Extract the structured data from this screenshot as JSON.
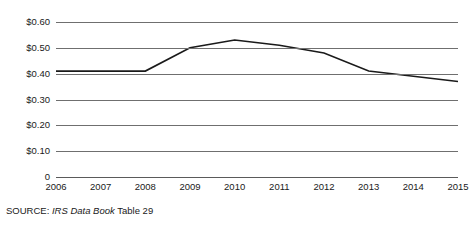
{
  "chart_data": {
    "type": "line",
    "title": "",
    "subtitle": "",
    "xlabel": "",
    "ylabel": "",
    "categories": [
      "2006",
      "2007",
      "2008",
      "2009",
      "2010",
      "2011",
      "2012",
      "2013",
      "2014",
      "2015"
    ],
    "values": [
      0.41,
      0.41,
      0.41,
      0.5,
      0.53,
      0.51,
      0.48,
      0.41,
      0.39,
      0.37
    ],
    "series": [
      {
        "name": "",
        "values": [
          0.41,
          0.41,
          0.41,
          0.5,
          0.53,
          0.51,
          0.48,
          0.41,
          0.39,
          0.37
        ]
      }
    ],
    "ylim": [
      0,
      0.6
    ],
    "xlim": [
      "2006",
      "2015"
    ],
    "ytick_values": [
      0.6,
      0.5,
      0.4,
      0.3,
      0.2,
      0.1,
      0
    ],
    "ytick_labels": [
      "$0.60",
      "$0.50",
      "$0.40",
      "$0.30",
      "$0.20",
      "$0.10",
      "0"
    ],
    "xtick_labels": [
      "2006",
      "2007",
      "2008",
      "2009",
      "2010",
      "2011",
      "2012",
      "2013",
      "2014",
      "2015"
    ],
    "grid": true,
    "grid_axis": "y",
    "legend": false,
    "legend_position": "none",
    "line_color": "#1a1a1a",
    "grid_color": "#6f6f6f",
    "background_color": "#ffffff",
    "annotations": []
  },
  "source_note": {
    "prefix": "SOURCE:",
    "italic": "IRS Data Book",
    "suffix": "Table 29",
    "full_text": "SOURCE: IRS Data Book Table 29"
  }
}
